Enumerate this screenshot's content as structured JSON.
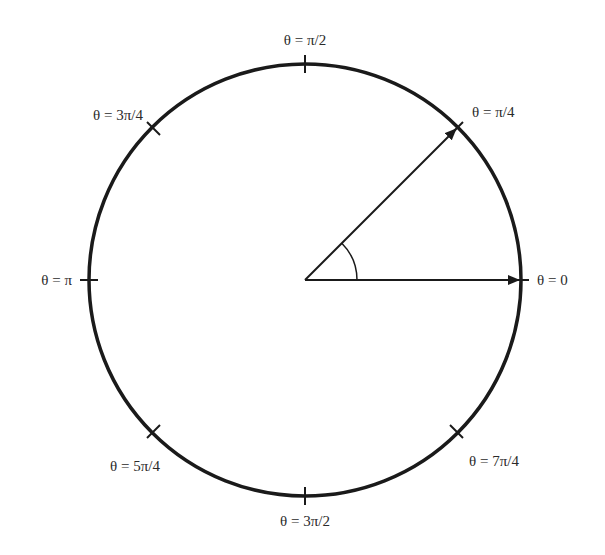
{
  "diagram": {
    "type": "unit-circle-angles",
    "center": {
      "x": 305,
      "y": 280
    },
    "radius": 216,
    "colors": {
      "stroke": "#1a1a1a",
      "text": "#2a2a2a",
      "background": "#ffffff"
    },
    "labels": {
      "theta_0": "θ = 0",
      "theta_pi_4": "θ = π/4",
      "theta_pi_2": "θ = π/2",
      "theta_3pi_4": "θ = 3π/4",
      "theta_pi": "θ = π",
      "theta_5pi_4": "θ = 5π/4",
      "theta_3pi_2": "θ = 3π/2",
      "theta_7pi_4": "θ = 7π/4"
    },
    "ticks": [
      "0",
      "π/4",
      "π/2",
      "3π/4",
      "π",
      "5π/4",
      "3π/2",
      "7π/4"
    ],
    "arrows": [
      {
        "name": "vector-theta-0",
        "angle": "0"
      },
      {
        "name": "vector-theta-pi-4",
        "angle": "π/4"
      }
    ],
    "angle_arc": {
      "from": "0",
      "to": "π/4",
      "radius": 52
    }
  }
}
